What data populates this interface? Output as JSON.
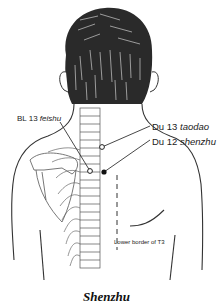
{
  "figure": {
    "caption": "Shenzhu",
    "labels": {
      "du13": {
        "code": "Du 13",
        "name": "taodao"
      },
      "du12": {
        "code": "Du 12",
        "name": "shenzhu"
      },
      "bl13": {
        "code": "BL 13",
        "name": "feishu"
      },
      "lower_border": "Lower border of T3"
    },
    "points": [
      {
        "id": "du13",
        "style": "open-circle"
      },
      {
        "id": "du12",
        "style": "filled-circle"
      },
      {
        "id": "bl13",
        "style": "open-circle"
      }
    ],
    "colors": {
      "line": "#333333",
      "hair": "#2a2a2a",
      "background": "#ffffff"
    }
  }
}
